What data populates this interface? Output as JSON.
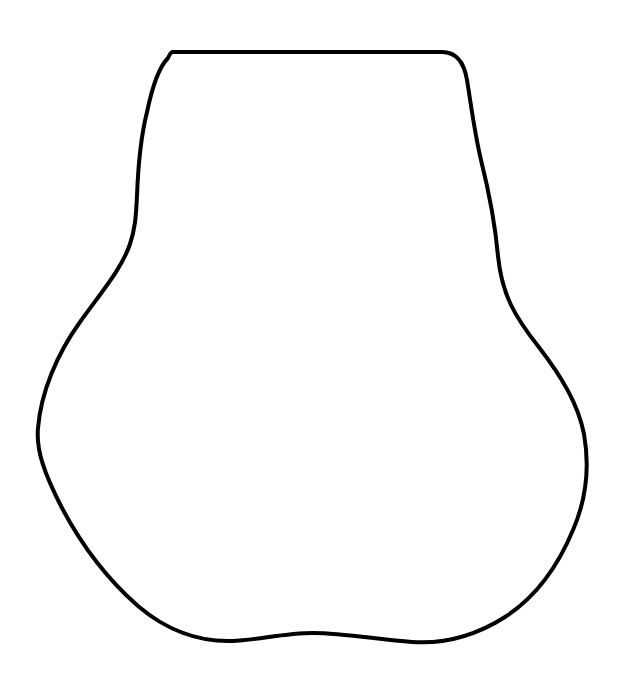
{
  "document": {
    "kind": "line-drawing",
    "title": "Closed Outline Shape",
    "width": 621,
    "height": 680,
    "background_color": "#ffffff"
  },
  "figure": {
    "name": "pear-shaped-closed-outline",
    "stroke_color": "#000000",
    "fill_color": "none",
    "stroke_width": 4,
    "stroke_linecap": "round",
    "stroke_linejoin": "round",
    "closed": true,
    "path": "M 172 52 L 442 52 C 456 52 464 62 467 80 C 471 104 474 130 481 160 C 489 192 495 222 498 256 C 502 296 516 318 538 346 C 562 377 578 404 584 434 C 590 468 586 500 573 530 C 558 566 536 597 505 617 C 472 638 441 644 412 642 C 380 640 345 633 313 633 C 284 633 258 640 232 641 C 199 642 166 630 138 606 C 106 578 80 542 62 508 C 44 473 36 450 38 428 C 41 392 57 354 80 322 C 103 290 122 268 130 244 C 136 226 136 212 137 196 C 138 168 141 136 147 112 C 152 88 158 68 168 58 C 169 56 170 53 172 52 Z",
    "key_points": [
      {
        "name": "top-left-shoulder-corner",
        "x": 172,
        "y": 52
      },
      {
        "name": "top-right-shoulder-corner",
        "x": 442,
        "y": 52
      },
      {
        "name": "right-waist-inflection",
        "x": 498,
        "y": 256
      },
      {
        "name": "rightmost-extent",
        "x": 586,
        "y": 440
      },
      {
        "name": "bottom-centre-bump-peak",
        "x": 305,
        "y": 633
      },
      {
        "name": "bottom-lowest-right",
        "x": 412,
        "y": 642
      },
      {
        "name": "leftmost-extent",
        "x": 38,
        "y": 450
      },
      {
        "name": "left-waist-inflection",
        "x": 136,
        "y": 220
      }
    ]
  }
}
